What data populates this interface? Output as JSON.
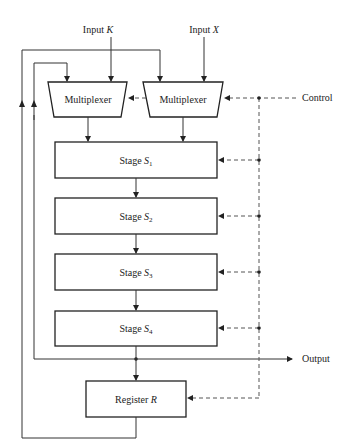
{
  "diagram": {
    "inputs": [
      {
        "label": "Input ",
        "var": "K"
      },
      {
        "label": "Input ",
        "var": "X"
      }
    ],
    "multiplexers": [
      {
        "label": "Multiplexer"
      },
      {
        "label": "Multiplexer"
      }
    ],
    "stages": [
      {
        "label": "Stage ",
        "var": "S",
        "sub": "1"
      },
      {
        "label": "Stage ",
        "var": "S",
        "sub": "2"
      },
      {
        "label": "Stage ",
        "var": "S",
        "sub": "3"
      },
      {
        "label": "Stage ",
        "var": "S",
        "sub": "4"
      }
    ],
    "register": {
      "label": "Register ",
      "var": "R"
    },
    "control_label": "Control",
    "output_label": "Output",
    "colors": {
      "line": "#333333",
      "dashed": "#555555",
      "text": "#222222"
    }
  }
}
